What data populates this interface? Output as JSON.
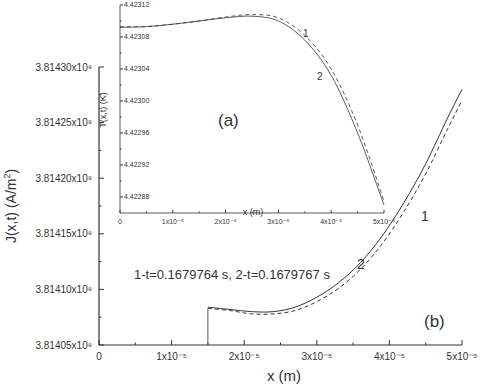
{
  "chart_data": [
    {
      "id": "b",
      "type": "line",
      "panel_label": "(b)",
      "title": "",
      "xlabel": "x (m)",
      "ylabel": "J(x,t) (A/m²)",
      "xlim": [
        0,
        5e-05
      ],
      "ylim": [
        3814050000.0,
        3814300000.0
      ],
      "xticks": [
        "0",
        "1x10⁻⁵",
        "2x10⁻⁵",
        "3x10⁻⁵",
        "4x10⁻⁵",
        "5x10⁻⁵"
      ],
      "yticks": [
        "3.81405x10⁹",
        "3.81410x10⁹",
        "3.81415x10⁹",
        "3.81420x10⁹",
        "3.81425x10⁹",
        "3.81430x10⁹"
      ],
      "annotation": "1-t=0.1679764 s, 2-t=0.1679767 s",
      "grid": false,
      "series": [
        {
          "name": "1",
          "style": "dashed",
          "x": [
            1.5e-05,
            1.8e-05,
            2.1e-05,
            2.4e-05,
            2.7e-05,
            3e-05,
            3.3e-05,
            3.6e-05,
            3.9e-05,
            4.2e-05,
            4.5e-05,
            4.8e-05,
            5e-05
          ],
          "y": [
            3814083000.0,
            3814081000.0,
            3814078000.0,
            3814078000.0,
            3814081000.0,
            3814089000.0,
            3814101000.0,
            3814118000.0,
            3814141000.0,
            3814170000.0,
            3814204000.0,
            3814244000.0,
            3814270000.0
          ]
        },
        {
          "name": "2",
          "style": "solid",
          "x": [
            1.5e-05,
            1.8e-05,
            2.1e-05,
            2.4e-05,
            2.7e-05,
            3e-05,
            3.3e-05,
            3.6e-05,
            3.9e-05,
            4.2e-05,
            4.5e-05,
            4.8e-05,
            5e-05
          ],
          "y": [
            3814084000.0,
            3814082000.0,
            3814080000.0,
            3814080000.0,
            3814084000.0,
            3814093000.0,
            3814106000.0,
            3814124000.0,
            3814148000.0,
            3814178000.0,
            3814213000.0,
            3814254000.0,
            3814280000.0
          ]
        }
      ],
      "series_labels": [
        {
          "text": "1",
          "x": 4.4e-05,
          "y": 3814150000.0
        },
        {
          "text": "2",
          "x": 3.6e-05,
          "y": 3814120000.0
        }
      ]
    },
    {
      "id": "a",
      "type": "line",
      "panel_label": "(a)",
      "title": "",
      "xlabel": "x (m)",
      "ylabel": "T(x,t) (K)",
      "xlim": [
        0,
        5e-05
      ],
      "ylim": [
        4.42286,
        4.42312
      ],
      "xticks": [
        "0",
        "1x10⁻⁵",
        "2x10⁻⁵",
        "3x10⁻⁵",
        "4x10⁻⁵",
        "5x10⁻⁵"
      ],
      "yticks": [
        "4.42288",
        "4.42292",
        "4.42296",
        "4.42300",
        "4.42304",
        "4.42308",
        "4.42312"
      ],
      "grid": false,
      "series": [
        {
          "name": "1",
          "style": "dashed",
          "x": [
            0,
            5e-06,
            1e-05,
            1.5e-05,
            2e-05,
            2.5e-05,
            3e-05,
            3.5e-05,
            4e-05,
            4.5e-05,
            5e-05
          ],
          "y": [
            4.423093,
            4.423093,
            4.423096,
            4.4231,
            4.423105,
            4.423108,
            4.423104,
            4.423082,
            4.42304,
            4.42297,
            4.422875
          ]
        },
        {
          "name": "2",
          "style": "solid",
          "x": [
            0,
            5e-06,
            1e-05,
            1.5e-05,
            2e-05,
            2.5e-05,
            3e-05,
            3.5e-05,
            4e-05,
            4.5e-05,
            5e-05
          ],
          "y": [
            4.423092,
            4.423093,
            4.423096,
            4.4231,
            4.423104,
            4.423106,
            4.4231,
            4.423076,
            4.423032,
            4.42296,
            4.42287
          ]
        }
      ],
      "series_labels": [
        {
          "text": "1",
          "x": 3.5e-05,
          "y": 4.423085
        },
        {
          "text": "2",
          "x": 3.7e-05,
          "y": 4.423045
        }
      ]
    }
  ],
  "labels": {
    "main_xlabel": "x (m)",
    "main_ylabel_prefix": "J(x,t) (A/m",
    "main_ylabel_sup": "2",
    "main_ylabel_suffix": ")",
    "main_panel": "(b)",
    "annotation": "1-t=0.1679764 s, 2-t=0.1679767 s",
    "inset_xlabel": "x (m)",
    "inset_ylabel": "T(x,t) (K)",
    "inset_panel": "(a)",
    "curve1": "1",
    "curve2": "2"
  }
}
